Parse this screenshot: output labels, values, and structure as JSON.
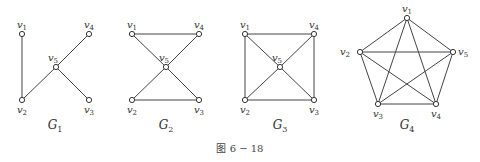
{
  "caption": "图 6 − 18",
  "graphs": [
    {
      "name": "G",
      "sub": "1",
      "vertices": [
        {
          "id": "v1",
          "base": "v",
          "sub": "1"
        },
        {
          "id": "v2",
          "base": "v",
          "sub": "2"
        },
        {
          "id": "v3",
          "base": "v",
          "sub": "3"
        },
        {
          "id": "v4",
          "base": "v",
          "sub": "4"
        },
        {
          "id": "v5",
          "base": "v",
          "sub": "5"
        }
      ],
      "edges": [
        [
          "v1",
          "v2"
        ],
        [
          "v2",
          "v5"
        ],
        [
          "v5",
          "v4"
        ],
        [
          "v5",
          "v3"
        ]
      ]
    },
    {
      "name": "G",
      "sub": "2",
      "vertices": [
        {
          "id": "v1",
          "base": "v",
          "sub": "1"
        },
        {
          "id": "v2",
          "base": "v",
          "sub": "2"
        },
        {
          "id": "v3",
          "base": "v",
          "sub": "3"
        },
        {
          "id": "v4",
          "base": "v",
          "sub": "4"
        },
        {
          "id": "v5",
          "base": "v",
          "sub": "5"
        }
      ],
      "edges": [
        [
          "v1",
          "v4"
        ],
        [
          "v2",
          "v3"
        ],
        [
          "v1",
          "v5"
        ],
        [
          "v5",
          "v3"
        ],
        [
          "v4",
          "v5"
        ],
        [
          "v5",
          "v2"
        ]
      ]
    },
    {
      "name": "G",
      "sub": "3",
      "vertices": [
        {
          "id": "v1",
          "base": "v",
          "sub": "1"
        },
        {
          "id": "v2",
          "base": "v",
          "sub": "2"
        },
        {
          "id": "v3",
          "base": "v",
          "sub": "3"
        },
        {
          "id": "v4",
          "base": "v",
          "sub": "4"
        },
        {
          "id": "v5",
          "base": "v",
          "sub": "5"
        }
      ],
      "edges": [
        [
          "v1",
          "v4"
        ],
        [
          "v2",
          "v3"
        ],
        [
          "v1",
          "v2"
        ],
        [
          "v4",
          "v3"
        ],
        [
          "v1",
          "v5"
        ],
        [
          "v5",
          "v3"
        ],
        [
          "v4",
          "v5"
        ],
        [
          "v5",
          "v2"
        ]
      ]
    },
    {
      "name": "G",
      "sub": "4",
      "vertices": [
        {
          "id": "v1",
          "base": "v",
          "sub": "1"
        },
        {
          "id": "v2",
          "base": "v",
          "sub": "2"
        },
        {
          "id": "v3",
          "base": "v",
          "sub": "3"
        },
        {
          "id": "v4",
          "base": "v",
          "sub": "4"
        },
        {
          "id": "v5",
          "base": "v",
          "sub": "5"
        }
      ],
      "edges": [
        [
          "v1",
          "v2"
        ],
        [
          "v1",
          "v3"
        ],
        [
          "v1",
          "v4"
        ],
        [
          "v1",
          "v5"
        ],
        [
          "v2",
          "v3"
        ],
        [
          "v2",
          "v4"
        ],
        [
          "v2",
          "v5"
        ],
        [
          "v3",
          "v4"
        ],
        [
          "v3",
          "v5"
        ],
        [
          "v4",
          "v5"
        ]
      ]
    }
  ]
}
